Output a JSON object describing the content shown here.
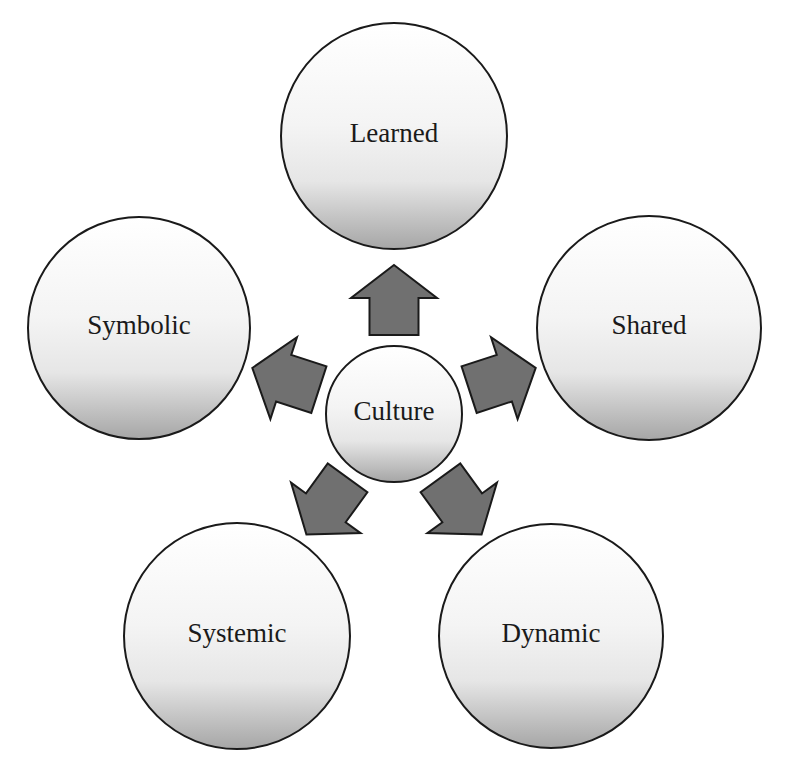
{
  "diagram": {
    "type": "radial",
    "center": {
      "label": "Culture",
      "cx": 394,
      "cy": 414,
      "r": 68,
      "font_size": 27
    },
    "satellites": [
      {
        "label": "Learned",
        "cx": 394,
        "cy": 136,
        "r": 113,
        "font_size": 27,
        "arrow_angle": 0
      },
      {
        "label": "Shared",
        "cx": 649,
        "cy": 328,
        "r": 112,
        "font_size": 27,
        "arrow_angle": 72
      },
      {
        "label": "Dynamic",
        "cx": 551,
        "cy": 636,
        "r": 112,
        "font_size": 27,
        "arrow_angle": 144
      },
      {
        "label": "Systemic",
        "cx": 237,
        "cy": 636,
        "r": 113,
        "font_size": 27,
        "arrow_angle": 216
      },
      {
        "label": "Symbolic",
        "cx": 139,
        "cy": 328,
        "r": 111,
        "font_size": 27,
        "arrow_angle": 288
      }
    ],
    "arrow_shape": "block-arrow",
    "colors": {
      "background": "#ffffff",
      "circle_stroke": "#1a1a1a",
      "circle_gradient_top": "#ffffff",
      "circle_gradient_mid": "#e6e6e6",
      "circle_gradient_bottom": "#a6a6a6",
      "arrow_fill": "#707070",
      "arrow_stroke": "#1a1a1a",
      "text": "#1a1a1a"
    }
  }
}
